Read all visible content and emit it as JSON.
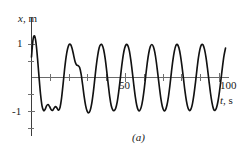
{
  "figure": {
    "caption": "(a)",
    "header_text_fragment": "also constant for a driven oscillator."
  },
  "axes": {
    "y_axis_label": "x",
    "y_axis_unit": ", m",
    "x_axis_label": "t",
    "x_axis_unit": ", s",
    "y_tick_labels": [
      "1",
      "-1"
    ],
    "x_tick_labels": [
      "50",
      "100"
    ],
    "curve_color": "#121212",
    "axis_color": "#3d3d3d",
    "zero_line_color": "#6a6a6a"
  },
  "chart_data": {
    "type": "line",
    "title": "",
    "subtitle": "",
    "xlabel": "t, s",
    "ylabel": "x, m",
    "xlim": [
      0,
      107
    ],
    "ylim": [
      -1.25,
      1.35
    ],
    "xticks": [
      50,
      100
    ],
    "yticks": [
      -1,
      1
    ],
    "grid": false,
    "legend": null,
    "annotations": [
      "(a)"
    ],
    "series": [
      {
        "name": "x(t)",
        "x": [
          0.0,
          0.8,
          1.6,
          2.4,
          3.2,
          4.0,
          4.8,
          5.6,
          6.4,
          7.2,
          8.0,
          8.8,
          9.6,
          10.4,
          11.2,
          12.0,
          12.8,
          13.6,
          14.4,
          15.2,
          16.0,
          16.8,
          17.6,
          18.4,
          19.2,
          20.0,
          20.8,
          21.6,
          22.4,
          23.2,
          24.0,
          24.8,
          25.6,
          26.4,
          27.2,
          28.0,
          28.8,
          29.6,
          30.4,
          31.2,
          32.0,
          32.8,
          33.6,
          34.4,
          35.2,
          36.0,
          36.8,
          37.6,
          38.4,
          39.2,
          40.0,
          40.8,
          41.6,
          42.4,
          43.2,
          44.0,
          44.8,
          45.6,
          46.4,
          47.2,
          48.0,
          48.8,
          49.6,
          50.4,
          51.2,
          52.0,
          52.8,
          53.6,
          54.4,
          55.2,
          56.0,
          56.8,
          57.6,
          58.4,
          59.2,
          60.0,
          60.8,
          61.6,
          62.4,
          63.2,
          64.0,
          64.8,
          65.6,
          66.4,
          67.2,
          68.0,
          68.8,
          69.6,
          70.4,
          71.2,
          72.0,
          72.8,
          73.6,
          74.4,
          75.2,
          76.0,
          76.8,
          77.6,
          78.4,
          79.2,
          80.0,
          80.8,
          81.6,
          82.4,
          83.2,
          84.0,
          84.8,
          85.6,
          86.4,
          87.2,
          88.0,
          88.8,
          89.6,
          90.4,
          91.2,
          92.0,
          92.8,
          93.6,
          94.4,
          95.2,
          96.0,
          96.8,
          97.6,
          98.4,
          99.2,
          100.0,
          100.8,
          101.6,
          102.4,
          103.2
        ],
        "y": [
          0.62,
          1.14,
          1.26,
          1.05,
          0.58,
          0.02,
          -0.5,
          -0.86,
          -1.0,
          -0.97,
          -0.86,
          -0.82,
          -0.88,
          -0.97,
          -1.0,
          -0.93,
          -0.88,
          -0.93,
          -0.99,
          -0.9,
          -0.62,
          -0.2,
          0.25,
          0.62,
          0.87,
          1.0,
          1.0,
          0.88,
          0.68,
          0.48,
          0.38,
          0.36,
          0.3,
          0.1,
          -0.22,
          -0.57,
          -0.85,
          -1.02,
          -1.07,
          -1.0,
          -0.8,
          -0.48,
          -0.08,
          0.33,
          0.66,
          0.9,
          1.0,
          0.98,
          0.84,
          0.57,
          0.2,
          -0.2,
          -0.58,
          -0.85,
          -0.98,
          -1.0,
          -0.93,
          -0.74,
          -0.43,
          -0.05,
          0.35,
          0.68,
          0.9,
          1.0,
          0.97,
          0.82,
          0.54,
          0.18,
          -0.22,
          -0.58,
          -0.85,
          -0.99,
          -1.0,
          -0.89,
          -0.66,
          -0.33,
          0.07,
          0.45,
          0.75,
          0.94,
          1.0,
          0.94,
          0.76,
          0.47,
          0.1,
          -0.28,
          -0.63,
          -0.88,
          -1.0,
          -0.99,
          -0.85,
          -0.6,
          -0.25,
          0.15,
          0.52,
          0.8,
          0.97,
          1.0,
          0.9,
          0.68,
          0.36,
          -0.02,
          -0.4,
          -0.71,
          -0.92,
          -1.0,
          -0.96,
          -0.8,
          -0.52,
          -0.16,
          0.24,
          0.6,
          0.86,
          0.99,
          0.99,
          0.86,
          0.62,
          0.28,
          -0.1,
          -0.47,
          -0.76,
          -0.95,
          -1.0,
          -0.92,
          -0.72,
          -0.42,
          -0.05,
          0.33,
          0.66,
          0.89
        ]
      }
    ]
  }
}
